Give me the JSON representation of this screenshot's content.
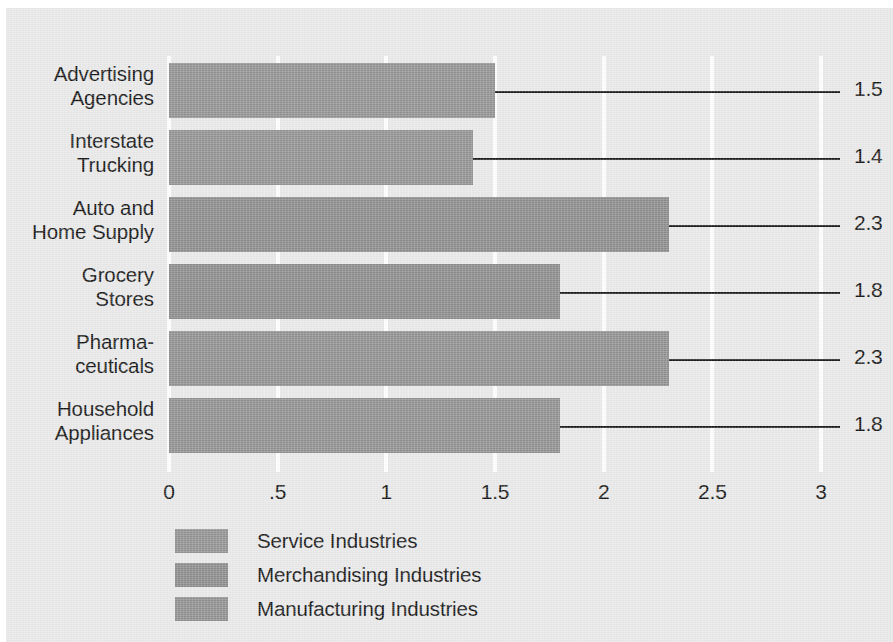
{
  "chart_data": {
    "type": "bar",
    "orientation": "horizontal",
    "title": "",
    "xlabel": "",
    "ylabel": "",
    "xlim": [
      0,
      3
    ],
    "grid": true,
    "legend_position": "bottom-left",
    "categories": [
      "Advertising\nAgencies",
      "Interstate\nTrucking",
      "Auto and\nHome Supply",
      "Grocery\nStores",
      "Pharma-\nceuticals",
      "Household\nAppliances"
    ],
    "category_lines": [
      [
        "Advertising",
        "Agencies"
      ],
      [
        "Interstate",
        "Trucking"
      ],
      [
        "Auto and",
        "Home Supply"
      ],
      [
        "Grocery",
        "Stores"
      ],
      [
        "Pharma-",
        "ceuticals"
      ],
      [
        "Household",
        "Appliances"
      ]
    ],
    "values": [
      1.5,
      1.4,
      2.3,
      1.8,
      2.3,
      1.8
    ],
    "value_labels": [
      "1.5",
      "1.4",
      "2.3",
      "1.8",
      "2.3",
      "1.8"
    ],
    "bar_colors": [
      "#919191",
      "#919191",
      "#8b8b8b",
      "#8b8b8b",
      "#8f8f8f",
      "#8f8f8f"
    ],
    "series_of_bar": [
      "Service Industries",
      "Service Industries",
      "Merchandising Industries",
      "Merchandising Industries",
      "Manufacturing Industries",
      "Manufacturing Industries"
    ],
    "xticks": [
      0,
      0.5,
      1,
      1.5,
      2,
      2.5,
      3
    ],
    "xtick_labels": [
      "0",
      ".5",
      "1",
      "1.5",
      "2",
      "2.5",
      "3"
    ],
    "legend": [
      {
        "label": "Service Industries",
        "color": "#919191"
      },
      {
        "label": "Merchandising Industries",
        "color": "#8b8b8b"
      },
      {
        "label": "Manufacturing Industries",
        "color": "#8f8f8f"
      }
    ]
  },
  "colors": {
    "background": "#e8e8e8",
    "gridline": "#fdfdfd",
    "text": "#141414",
    "leader_line": "#1a1a1a"
  }
}
